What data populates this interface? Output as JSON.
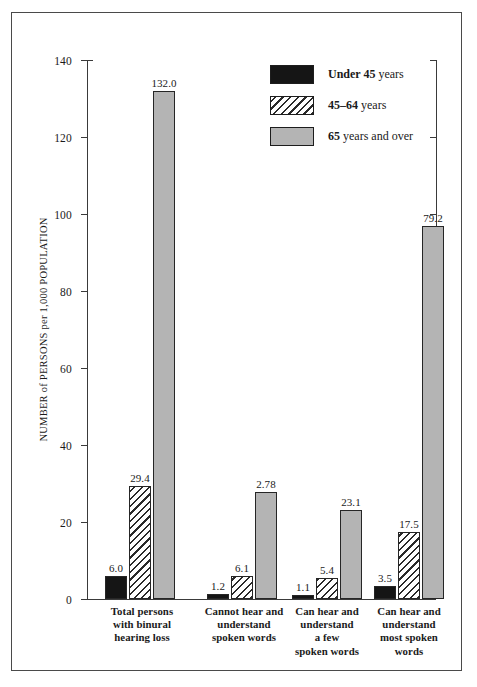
{
  "chart_data": {
    "type": "bar",
    "title": "",
    "xlabel": "",
    "ylabel": "NUMBER of PERSONS per 1,000 POPULATION",
    "ylim": [
      0,
      140
    ],
    "yticks": [
      0,
      20,
      40,
      60,
      80,
      100,
      120,
      140
    ],
    "grid": false,
    "legend_position": "top-right",
    "categories": [
      "Total persons with binural hearing loss",
      "Cannot hear and understand spoken words",
      "Can hear and understand a few spoken words",
      "Can hear and understand most spoken words"
    ],
    "category_lines": [
      [
        "Total persons",
        "with binural",
        "hearing loss"
      ],
      [
        "Cannot hear and",
        "understand",
        "spoken words"
      ],
      [
        "Can hear and",
        "understand",
        "a few",
        "spoken words"
      ],
      [
        "Can hear and",
        "understand",
        "most spoken",
        "words"
      ]
    ],
    "series": [
      {
        "name": "Under 45 years",
        "color": "#151515",
        "pattern": "solid-black",
        "values": [
          6.0,
          1.2,
          1.1,
          3.5
        ],
        "labels": [
          "6.0",
          "1.2",
          "1.1",
          "3.5"
        ]
      },
      {
        "name": "45–64 years",
        "color": "#ffffff",
        "pattern": "diagonal-hatch",
        "values": [
          29.4,
          6.1,
          5.4,
          17.5
        ],
        "labels": [
          "29.4",
          "6.1",
          "5.4",
          "17.5"
        ]
      },
      {
        "name": "65 years and over",
        "color": "#b4b4b4",
        "pattern": "solid-gray",
        "values": [
          132.0,
          27.8,
          23.1,
          97.0
        ],
        "labels": [
          "132.0",
          "2.78",
          "23.1",
          "79.2"
        ]
      }
    ]
  },
  "legend": {
    "items": [
      {
        "label_bold": "Under 45",
        "label_rest": " years"
      },
      {
        "label_bold": "45–64",
        "label_rest": " years"
      },
      {
        "label_bold": "65",
        "label_rest": " years and over"
      }
    ]
  },
  "axis": {
    "y_title": "NUMBER of PERSONS per 1,000 POPULATION",
    "tick_labels": [
      "0",
      "20",
      "40",
      "60",
      "80",
      "100",
      "120",
      "140"
    ]
  }
}
